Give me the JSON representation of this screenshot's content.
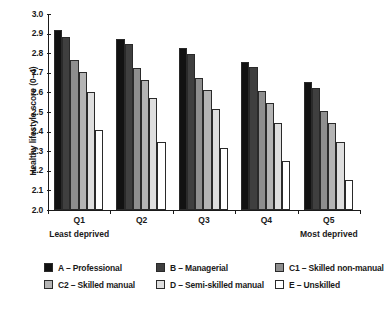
{
  "chart_data": {
    "type": "bar",
    "title": "",
    "xlabel": "",
    "ylabel": "Healthy lifestyle score (0–4)",
    "ylim": [
      2.0,
      3.0
    ],
    "ytick_step": 0.1,
    "yticks": [
      "3.0",
      "2.9",
      "2.8",
      "2.7",
      "2.6",
      "2.5",
      "2.4",
      "2.3",
      "2.2",
      "2.1",
      "2.0"
    ],
    "grid": false,
    "legend_position": "bottom",
    "categories": [
      "Q1",
      "Q2",
      "Q3",
      "Q4",
      "Q5"
    ],
    "category_annotations": {
      "Q1": "Least deprived",
      "Q5": "Most deprived"
    },
    "series": [
      {
        "name": "A – Professional",
        "color": "#121212",
        "values": [
          2.92,
          2.87,
          2.825,
          2.755,
          2.655
        ]
      },
      {
        "name": "B – Managerial",
        "color": "#3f3f3f",
        "values": [
          2.885,
          2.845,
          2.795,
          2.73,
          2.625
        ]
      },
      {
        "name": "C1 – Skilled non-manual",
        "color": "#8e8e8e",
        "values": [
          2.765,
          2.725,
          2.675,
          2.605,
          2.505
        ]
      },
      {
        "name": "C2 – Skilled manual",
        "color": "#b4b4b4",
        "values": [
          2.705,
          2.665,
          2.61,
          2.545,
          2.445
        ]
      },
      {
        "name": "D – Semi-skilled manual",
        "color": "#dedede",
        "values": [
          2.6,
          2.57,
          2.515,
          2.445,
          2.345
        ]
      },
      {
        "name": "E – Unskilled",
        "color": "#ffffff",
        "values": [
          2.41,
          2.345,
          2.315,
          2.25,
          2.155
        ]
      }
    ]
  },
  "legend": {
    "entries": [
      {
        "label": "A – Professional"
      },
      {
        "label": "B – Managerial"
      },
      {
        "label": "C1 – Skilled non-manual"
      },
      {
        "label": "C2 – Skilled manual"
      },
      {
        "label": "D – Semi-skilled manual"
      },
      {
        "label": "E – Unskilled"
      }
    ]
  }
}
